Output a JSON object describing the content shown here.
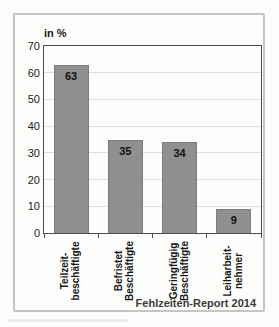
{
  "chart_data": {
    "type": "bar",
    "title": "",
    "unit_label": "in %",
    "categories": [
      {
        "label": "Teilzeitbeschäftigte",
        "lines": [
          "Teilzeit-",
          "beschäftigte"
        ]
      },
      {
        "label": "Befristet Beschäftigte",
        "lines": [
          "Befristet",
          "Beschäftigte"
        ]
      },
      {
        "label": "Geringfügig Beschäftigte",
        "lines": [
          "Geringfügig",
          "Beschäftigte"
        ]
      },
      {
        "label": "Leiharbeitnehmer",
        "lines": [
          "Leiharbeit-",
          "nehmer"
        ]
      }
    ],
    "values": [
      63,
      35,
      34,
      9
    ],
    "xlabel": "",
    "ylabel": "in %",
    "ylim": [
      0,
      70
    ],
    "yticks": [
      0,
      10,
      20,
      30,
      40,
      50,
      60,
      70
    ],
    "grid": true,
    "legend_position": "none",
    "source": "Fehlzeiten-Report 2014",
    "colors": {
      "bar": "#8f8f8f",
      "bar_border": "#7c7c7c",
      "grid": "#dededc",
      "axis": "#4d4d4d",
      "frame_border": "#c5c5c2",
      "background": "#fdfdfb"
    }
  }
}
